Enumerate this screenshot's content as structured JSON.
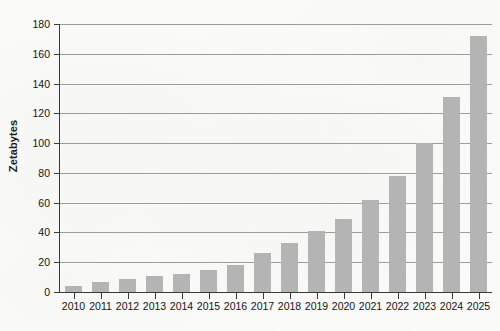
{
  "chart_data": {
    "type": "bar",
    "title": "",
    "xlabel": "",
    "ylabel": "Zetabytes",
    "categories": [
      "2010",
      "2011",
      "2012",
      "2013",
      "2014",
      "2015",
      "2016",
      "2017",
      "2018",
      "2019",
      "2020",
      "2021",
      "2022",
      "2023",
      "2024",
      "2025"
    ],
    "values": [
      4,
      7,
      9,
      11,
      12,
      15,
      18,
      26,
      33,
      41,
      49,
      62,
      78,
      100,
      131,
      172
    ],
    "ylim": [
      0,
      180
    ],
    "ytick_labels": [
      "0",
      "20",
      "40",
      "60",
      "80",
      "100",
      "120",
      "140",
      "160",
      "180"
    ],
    "ytick_values": [
      0,
      20,
      40,
      60,
      80,
      100,
      120,
      140,
      160,
      180
    ],
    "grid": true,
    "legend": false,
    "series": [
      {
        "name": "Zetabytes",
        "color": "#b4b4b4",
        "values": [
          4,
          7,
          9,
          11,
          12,
          15,
          18,
          26,
          33,
          41,
          49,
          62,
          78,
          100,
          131,
          172
        ]
      }
    ]
  },
  "style": {
    "bar_color": "#b4b4b4",
    "grid_color": "#9c9c9c",
    "axis_color": "#3a3a3a",
    "text_color": "#141414",
    "background": "#fbfbfa"
  }
}
